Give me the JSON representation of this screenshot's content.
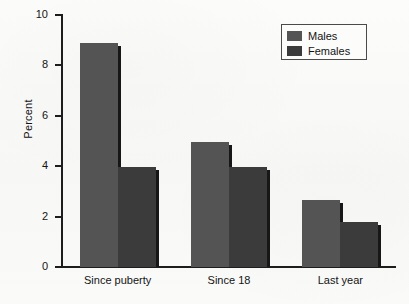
{
  "chart_data": {
    "type": "bar",
    "title": "",
    "subtitle": "",
    "xlabel": "",
    "ylabel": "Percent",
    "categories": [
      "Since puberty",
      "Since 18",
      "Last year"
    ],
    "series": [
      {
        "name": "Males",
        "color": "#545454",
        "values": [
          8.9,
          4.95,
          2.65
        ]
      },
      {
        "name": "Females",
        "color": "#3b3b3b",
        "values": [
          3.95,
          3.95,
          1.8
        ]
      }
    ],
    "ylim": [
      0,
      10
    ],
    "yticks": [
      0,
      2,
      4,
      6,
      8,
      10
    ],
    "ytick_labels": [
      "0",
      "2",
      "4",
      "6",
      "8",
      "10"
    ],
    "grid": false,
    "legend_position": "top-right",
    "legend_entries": [
      "Males",
      "Females"
    ],
    "axis_frame": "left-bottom"
  },
  "legend": {
    "items": [
      {
        "label": "Males"
      },
      {
        "label": "Females"
      }
    ]
  }
}
